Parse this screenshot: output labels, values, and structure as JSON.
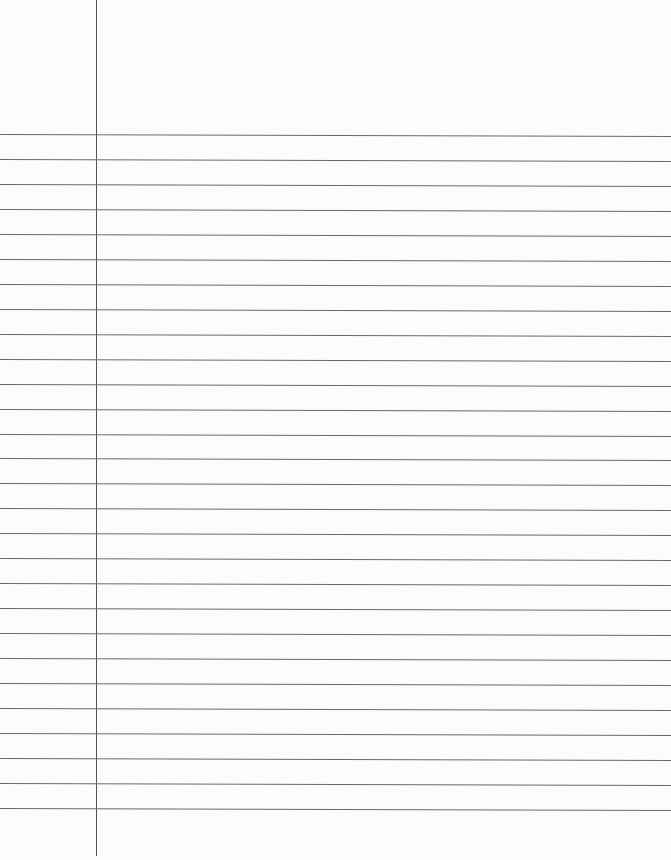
{
  "paper": {
    "type": "lined-paper",
    "background": "#fcfcfc",
    "rule_color": "#6a6a6a",
    "margin_color": "#555555",
    "first_rule_y": 134,
    "rule_spacing": 24.96,
    "rule_count": 28,
    "margin_x": 96,
    "margin_bottom": 856,
    "text": []
  }
}
